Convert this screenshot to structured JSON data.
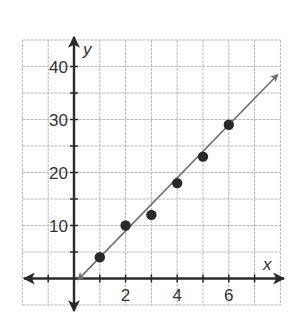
{
  "chart_data": {
    "type": "scatter",
    "title": "",
    "xlabel": "x",
    "ylabel": "y",
    "xlim": [
      -2,
      8
    ],
    "ylim": [
      -5,
      45
    ],
    "x_ticks": [
      2,
      4,
      6
    ],
    "y_ticks": [
      10,
      20,
      30,
      40
    ],
    "x_tick_labels": [
      "2",
      "4",
      "6"
    ],
    "y_tick_labels": [
      "10",
      "20",
      "30",
      "40"
    ],
    "grid": true,
    "grid_x_step": 1,
    "grid_y_step": 5,
    "legend": null,
    "series": [
      {
        "name": "data points",
        "type": "scatter",
        "x": [
          1,
          2,
          3,
          4,
          5,
          6
        ],
        "y": [
          4,
          10,
          12,
          18,
          23,
          29
        ]
      },
      {
        "name": "trend line",
        "type": "line",
        "slope": 5,
        "intercept": -1,
        "x_range": [
          0.15,
          7.9
        ],
        "arrows": "both"
      }
    ]
  },
  "axes": {
    "x_name": "x",
    "y_name": "y"
  },
  "colors": {
    "grid": "#b8b8b8",
    "axis": "#2a2a2a",
    "line": "#6e6e6e",
    "point": "#2a2a2a",
    "text": "#333333"
  }
}
